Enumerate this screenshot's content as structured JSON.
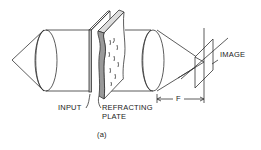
{
  "figure": {
    "caption": "(a)",
    "labels": {
      "input": "INPUT",
      "refracting_line1": "REFRACTING",
      "refracting_line2": "PLATE",
      "focal_length": "F",
      "image": "IMAGE"
    },
    "colors": {
      "line": "#333333",
      "background": "#ffffff"
    }
  }
}
